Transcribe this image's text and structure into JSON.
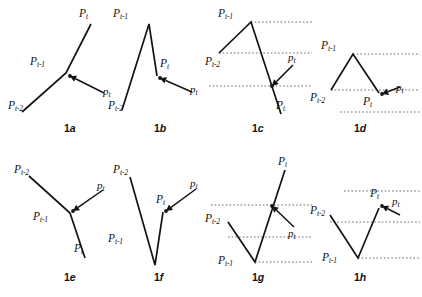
{
  "figure": {
    "background_color": "#ffffff",
    "stroke_color": "#141414",
    "guide_color": "#4d4d4d",
    "label_names": {
      "p_t_upper": "P",
      "p_t_lower": "p",
      "sub_t": "t",
      "sub_t1": "t-1",
      "sub_t2": "t-2"
    },
    "panels": [
      {
        "id": "1a",
        "caption_num": "1",
        "caption_letter": "a",
        "caption_x": 64,
        "caption_y": 122,
        "type": "open-angle",
        "description": "P(t-2) lower-left rises to junction P(t-1), continues up-right to P(t); candidate p(t) arrow enters junction from lower-right",
        "points": [
          {
            "name": "P_t",
            "x": 91,
            "y": 24,
            "label": "upper",
            "sub": "t",
            "label_x": 79,
            "label_y": 8
          },
          {
            "name": "P_t-1",
            "x": 66,
            "y": 73,
            "label": "upper",
            "sub": "t-1",
            "label_x": 30,
            "label_y": 56
          },
          {
            "name": "P_t-2",
            "x": 22,
            "y": 112,
            "label": "upper",
            "sub": "t-2",
            "label_x": 8,
            "label_y": 100
          }
        ],
        "polyline": "22,112 66,73 91,24",
        "arrow": {
          "from_x": 104,
          "from_y": 93,
          "to_x": 70,
          "to_y": 76,
          "label": "lower",
          "sub": "t",
          "label_x": 103,
          "label_y": 86
        },
        "guides": []
      },
      {
        "id": "1b",
        "caption_num": "1",
        "caption_letter": "b",
        "caption_x": 154,
        "caption_y": 122,
        "type": "peak",
        "description": "P(t-2) bottom-left rises steeply to peak P(t-1), falls to P(t); p(t) arrow enters P(t) from lower-right",
        "points": [
          {
            "name": "P_t-1",
            "x": 149,
            "y": 24,
            "label": "upper",
            "sub": "t-1",
            "label_x": 113,
            "label_y": 8
          },
          {
            "name": "P_t",
            "x": 157,
            "y": 76,
            "label": "upper",
            "sub": "t",
            "label_x": 160,
            "label_y": 58
          },
          {
            "name": "P_t-2",
            "x": 122,
            "y": 110,
            "label": "upper",
            "sub": "t-2",
            "label_x": 108,
            "label_y": 100
          }
        ],
        "polyline": "122,110 149,24 157,76",
        "arrow": {
          "from_x": 192,
          "from_y": 92,
          "to_x": 160,
          "to_y": 78,
          "label": "lower",
          "sub": "t",
          "label_x": 190,
          "label_y": 84
        },
        "guides": []
      },
      {
        "id": "1c",
        "caption_num": "1",
        "caption_letter": "c",
        "caption_x": 252,
        "caption_y": 122,
        "type": "peak-with-guides",
        "description": "Rise from P(t-2) to peak P(t-1), long fall to P(t) below; dotted horizontal reference levels; p(t) arrow marks crossing level",
        "points": [
          {
            "name": "P_t-1",
            "x": 251,
            "y": 22,
            "label": "upper",
            "sub": "t-1",
            "label_x": 218,
            "label_y": 8
          },
          {
            "name": "P_t-2",
            "x": 219,
            "y": 53,
            "label": "upper",
            "sub": "t-2",
            "label_x": 205,
            "label_y": 56
          },
          {
            "name": "P_t",
            "x": 281,
            "y": 114,
            "label": "upper",
            "sub": "t",
            "label_x": 276,
            "label_y": 100
          }
        ],
        "polyline": "219,53 251,22 281,114",
        "arrow": {
          "from_x": 293,
          "from_y": 65,
          "to_x": 272,
          "to_y": 86,
          "label": "lower",
          "sub": "t",
          "label_x": 288,
          "label_y": 52
        },
        "guides": [
          {
            "y": 22,
            "x1": 251,
            "x2": 312
          },
          {
            "y": 53,
            "x1": 219,
            "x2": 312
          },
          {
            "y": 86,
            "x1": 209,
            "x2": 312
          }
        ]
      },
      {
        "id": "1d",
        "caption_num": "1",
        "caption_letter": "d",
        "caption_x": 354,
        "caption_y": 122,
        "type": "peak-with-guides",
        "description": "Rise from P(t-2) to peak P(t-1), fall to P(t); three dotted reference levels; short p(t) arrow from the right",
        "points": [
          {
            "name": "P_t-1",
            "x": 353,
            "y": 54,
            "label": "upper",
            "sub": "t-1",
            "label_x": 321,
            "label_y": 40
          },
          {
            "name": "P_t-2",
            "x": 331,
            "y": 90,
            "label": "upper",
            "sub": "t-2",
            "label_x": 310,
            "label_y": 92
          },
          {
            "name": "P_t",
            "x": 379,
            "y": 93,
            "label": "upper",
            "sub": "t",
            "label_x": 363,
            "label_y": 96
          }
        ],
        "polyline": "331,90 353,54 379,93",
        "arrow": {
          "from_x": 400,
          "from_y": 87,
          "to_x": 382,
          "to_y": 94,
          "label": "lower",
          "sub": "t",
          "label_x": 396,
          "label_y": 82
        },
        "guides": [
          {
            "y": 54,
            "x1": 353,
            "x2": 420
          },
          {
            "y": 90,
            "x1": 331,
            "x2": 420
          },
          {
            "y": 112,
            "x1": 340,
            "x2": 420
          }
        ]
      },
      {
        "id": "1e",
        "caption_num": "1",
        "caption_letter": "e",
        "caption_x": 64,
        "caption_y": 271,
        "type": "open-angle",
        "description": "P(t-2) upper-left falls to junction P(t-1), continues down-right to P(t); p(t) arrow enters junction from upper-right",
        "points": [
          {
            "name": "P_t-2",
            "x": 29,
            "y": 176,
            "label": "upper",
            "sub": "t-2",
            "label_x": 14,
            "label_y": 164
          },
          {
            "name": "P_t-1",
            "x": 70,
            "y": 213,
            "label": "upper",
            "sub": "t-1",
            "label_x": 33,
            "label_y": 211
          },
          {
            "name": "P_t",
            "x": 85,
            "y": 258,
            "label": "upper",
            "sub": "t",
            "label_x": 74,
            "label_y": 243
          }
        ],
        "polyline": "29,176 70,213 85,258",
        "arrow": {
          "from_x": 103,
          "from_y": 190,
          "to_x": 73,
          "to_y": 211,
          "label": "lower",
          "sub": "t",
          "label_x": 97,
          "label_y": 180
        },
        "guides": []
      },
      {
        "id": "1f",
        "caption_num": "1",
        "caption_letter": "f",
        "caption_x": 154,
        "caption_y": 271,
        "type": "valley",
        "description": "P(t-2) top-left drops steeply to valley P(t-1) at bottom, rises to P(t); p(t) arrow enters P(t) from upper-right",
        "points": [
          {
            "name": "P_t-2",
            "x": 130,
            "y": 177,
            "label": "upper",
            "sub": "t-2",
            "label_x": 113,
            "label_y": 164
          },
          {
            "name": "P_t-1",
            "x": 155,
            "y": 265,
            "label": "upper",
            "sub": "t-1",
            "label_x": 108,
            "label_y": 233
          },
          {
            "name": "P_t",
            "x": 163,
            "y": 212,
            "label": "upper",
            "sub": "t",
            "label_x": 156,
            "label_y": 194
          }
        ],
        "polyline": "130,177 155,265 163,212",
        "arrow": {
          "from_x": 196,
          "from_y": 189,
          "to_x": 166,
          "to_y": 211,
          "label": "lower",
          "sub": "t",
          "label_x": 190,
          "label_y": 178
        },
        "guides": []
      },
      {
        "id": "1g",
        "caption_num": "1",
        "caption_letter": "g",
        "caption_x": 252,
        "caption_y": 271,
        "type": "valley-with-guides",
        "description": "P(t-2) mid-left falls to P(t-1) at bottom, steep rise to P(t) at top; dotted reference levels; p(t) arrow marks crossing level",
        "points": [
          {
            "name": "P_t",
            "x": 285,
            "y": 170,
            "label": "upper",
            "sub": "t",
            "label_x": 278,
            "label_y": 156
          },
          {
            "name": "P_t-2",
            "x": 228,
            "y": 222,
            "label": "upper",
            "sub": "t-2",
            "label_x": 205,
            "label_y": 213
          },
          {
            "name": "P_t-1",
            "x": 255,
            "y": 262,
            "label": "upper",
            "sub": "t-1",
            "label_x": 218,
            "label_y": 255
          }
        ],
        "polyline": "228,222 255,262 285,170",
        "arrow": {
          "from_x": 294,
          "from_y": 227,
          "to_x": 272,
          "to_y": 206,
          "label": "lower",
          "sub": "t",
          "label_x": 288,
          "label_y": 228
        },
        "guides": [
          {
            "y": 205,
            "x1": 211,
            "x2": 312
          },
          {
            "y": 237,
            "x1": 228,
            "x2": 312
          },
          {
            "y": 262,
            "x1": 255,
            "x2": 312
          }
        ]
      },
      {
        "id": "1h",
        "caption_num": "1",
        "caption_letter": "h",
        "caption_x": 354,
        "caption_y": 271,
        "type": "valley-with-guides",
        "description": "P(t-2) upper-left falls to P(t-1) at bottom, rises to P(t); three dotted reference levels; p(t) arrow enters P(t) from the right",
        "points": [
          {
            "name": "P_t-2",
            "x": 330,
            "y": 215,
            "label": "upper",
            "sub": "t-2",
            "label_x": 310,
            "label_y": 205
          },
          {
            "name": "P_t-1",
            "x": 358,
            "y": 258,
            "label": "upper",
            "sub": "t-1",
            "label_x": 322,
            "label_y": 252
          },
          {
            "name": "P_t",
            "x": 379,
            "y": 208,
            "label": "upper",
            "sub": "t",
            "label_x": 370,
            "label_y": 188
          }
        ],
        "polyline": "330,215 358,258 379,208",
        "arrow": {
          "from_x": 400,
          "from_y": 215,
          "to_x": 382,
          "to_y": 206,
          "label": "lower",
          "sub": "t",
          "label_x": 392,
          "label_y": 196
        },
        "guides": [
          {
            "y": 191,
            "x1": 344,
            "x2": 420
          },
          {
            "y": 222,
            "x1": 330,
            "x2": 420
          },
          {
            "y": 258,
            "x1": 358,
            "x2": 420
          }
        ]
      }
    ]
  }
}
